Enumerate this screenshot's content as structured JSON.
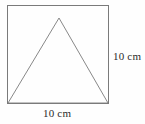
{
  "figure": {
    "background_color": "#fefefe",
    "stroke_color": "#7a7a7a",
    "text_color": "#2b2b2b",
    "stroke_width": 1,
    "square": {
      "name": "outer-square",
      "x": 7,
      "y": 5,
      "width": 101,
      "height": 98,
      "side_length_label": "10 cm"
    },
    "triangle": {
      "name": "inscribed-triangle",
      "apex": {
        "x": 59,
        "y": 18
      },
      "base_left": {
        "x": 8,
        "y": 103
      },
      "base_right": {
        "x": 108,
        "y": 103
      },
      "points": "59,18 8,103 108,103"
    },
    "labels": {
      "right": {
        "text": "10 cm",
        "value": 10,
        "unit": "cm",
        "position": "right-of-square"
      },
      "bottom": {
        "text": "10 cm",
        "value": 10,
        "unit": "cm",
        "position": "below-square"
      }
    }
  }
}
